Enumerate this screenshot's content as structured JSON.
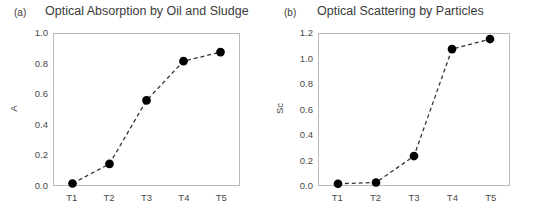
{
  "figure": {
    "background": "#ffffff",
    "marker_color": "#000000",
    "line_color": "#333333",
    "frame_color": "#b9b9b9",
    "tick_color": "#4a4a4a"
  },
  "panels": [
    {
      "tag": "(a)",
      "title": "Optical Absorption by Oil and Sludge"
    },
    {
      "tag": "(b)",
      "title": "Optical Scattering by Particles"
    }
  ],
  "chart_data": [
    {
      "type": "line",
      "title": "Optical Absorption by Oil and Sludge",
      "panel_tag": "(a)",
      "xlabel": "",
      "ylabel": "A",
      "categories": [
        "T1",
        "T2",
        "T3",
        "T4",
        "T5"
      ],
      "values": [
        0.01,
        0.14,
        0.56,
        0.82,
        0.88
      ],
      "ylim": [
        0.0,
        1.0
      ],
      "yticks": [
        "0.0",
        "0.2",
        "0.4",
        "0.6",
        "0.8",
        "1.0"
      ],
      "ytick_values": [
        0.0,
        0.2,
        0.4,
        0.6,
        0.8,
        1.0
      ],
      "grid": false,
      "legend": "none",
      "line_style": "dashed",
      "marker": "filled-circle"
    },
    {
      "type": "line",
      "title": "Optical Scattering by Particles",
      "panel_tag": "(b)",
      "xlabel": "",
      "ylabel": "Sc",
      "categories": [
        "T1",
        "T2",
        "T3",
        "T4",
        "T5"
      ],
      "values": [
        0.01,
        0.02,
        0.23,
        1.08,
        1.16
      ],
      "ylim": [
        0.0,
        1.2
      ],
      "yticks": [
        "0.0",
        "0.2",
        "0.4",
        "0.6",
        "0.8",
        "1.0",
        "1.2"
      ],
      "ytick_values": [
        0.0,
        0.2,
        0.4,
        0.6,
        0.8,
        1.0,
        1.2
      ],
      "grid": false,
      "legend": "none",
      "line_style": "dashed",
      "marker": "filled-circle"
    }
  ]
}
